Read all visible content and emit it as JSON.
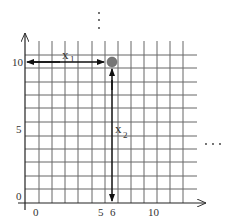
{
  "diagram": {
    "type": "grid-coordinate-plot",
    "x_axis": {
      "tick_labels": [
        "0",
        "5",
        "6",
        "10"
      ],
      "continuation": "..."
    },
    "y_axis": {
      "tick_labels": [
        "0",
        "5",
        "10"
      ],
      "continuation": "⋮"
    },
    "point": {
      "x": 6,
      "y": 10,
      "color": "#777777"
    },
    "arrows": [
      {
        "label": "x",
        "subscript": "1",
        "direction": "horizontal",
        "from": "y-axis at 10",
        "to": "point"
      },
      {
        "label": "x",
        "subscript": "2",
        "direction": "vertical",
        "from": "point",
        "to": "x-axis at 6"
      }
    ],
    "colors": {
      "grid": "#555555",
      "axis": "#222222",
      "point": "#777777"
    }
  }
}
